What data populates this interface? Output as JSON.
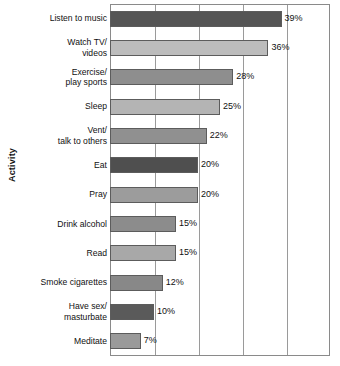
{
  "chart_data": {
    "type": "bar",
    "orientation": "horizontal",
    "title": "",
    "xlabel": "",
    "ylabel": "Activity",
    "xlim": [
      0,
      50
    ],
    "grid": true,
    "gridline_values": [
      0,
      10,
      20,
      30,
      40,
      50
    ],
    "legend": null,
    "value_suffix": "%",
    "categories": [
      "Listen to music",
      "Watch TV/\nvideos",
      "Exercise/\nplay sports",
      "Sleep",
      "Vent/\ntalk to others",
      "Eat",
      "Pray",
      "Drink alcohol",
      "Read",
      "Smoke cigarettes",
      "Have sex/\nmasturbate",
      "Meditate"
    ],
    "values": [
      39,
      36,
      28,
      25,
      22,
      20,
      20,
      15,
      15,
      12,
      10,
      7
    ],
    "labels": [
      "39%",
      "36%",
      "28%",
      "25%",
      "22%",
      "20%",
      "20%",
      "15%",
      "15%",
      "12%",
      "10%",
      "7%"
    ],
    "bar_colors": [
      "#555555",
      "#bcbcbc",
      "#8e8e8e",
      "#b4b4b4",
      "#909090",
      "#4f4f4f",
      "#9c9c9c",
      "#8c8c8c",
      "#a8a8a8",
      "#888888",
      "#5a5a5a",
      "#9a9a9a"
    ]
  },
  "axis": {
    "y_title": "Activity"
  }
}
